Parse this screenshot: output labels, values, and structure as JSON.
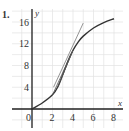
{
  "problem": {
    "number_label": "1."
  },
  "chart_data": {
    "type": "line",
    "title": "",
    "xlabel": "x",
    "ylabel": "y",
    "xlim": [
      -2,
      8.8
    ],
    "ylim": [
      -3.4,
      18
    ],
    "x_ticks": [
      0,
      2,
      4,
      6,
      8
    ],
    "x_tick_labels": [
      "0",
      "2",
      "4",
      "6",
      "8"
    ],
    "y_ticks": [
      4,
      8,
      12,
      16
    ],
    "y_tick_labels": [
      "4",
      "8",
      "12",
      "16"
    ],
    "grid": true,
    "grid_minor_step": {
      "x": 1,
      "y": 2
    },
    "series": [
      {
        "name": "curve",
        "role": "function graph",
        "x": [
          0,
          1,
          2,
          2.5,
          3,
          3.5,
          4,
          4.5,
          5,
          6,
          7,
          8
        ],
        "y": [
          0,
          1.1,
          2.6,
          4.0,
          6.3,
          8.8,
          10.8,
          12.3,
          13.4,
          14.9,
          15.9,
          16.6
        ]
      },
      {
        "name": "tangent line",
        "role": "tangent at x=4",
        "x": [
          2.1,
          5.0
        ],
        "y": [
          4.0,
          15.8
        ]
      },
      {
        "name": "secant 1",
        "role": "secant through (2,2.6) and (4,10.8)",
        "x": [
          2.0,
          4.0
        ],
        "y": [
          2.6,
          10.8
        ]
      },
      {
        "name": "secant 2",
        "role": "secant through (2.5,4) and (4,10.8)",
        "x": [
          2.5,
          4.0
        ],
        "y": [
          4.0,
          10.8
        ]
      },
      {
        "name": "secant 3",
        "role": "secant through (3,6.3) and (4,10.8)",
        "x": [
          3.0,
          4.0
        ],
        "y": [
          6.3,
          10.8
        ]
      }
    ],
    "colors": {
      "curve": "#333333",
      "tangent": "#888888",
      "secant": "#555555",
      "grid": "#e2e2e2",
      "axis": "#222222"
    }
  }
}
